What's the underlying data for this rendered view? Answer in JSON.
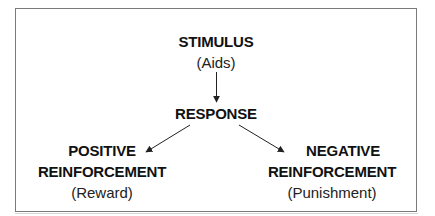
{
  "diagram": {
    "nodes": {
      "stimulus": {
        "title": "STIMULUS",
        "subtitle": "(Aids)"
      },
      "response": {
        "title": "RESPONSE"
      },
      "positive": {
        "title_line1": "POSITIVE",
        "title_line2": "REINFORCEMENT",
        "subtitle": "(Reward)"
      },
      "negative": {
        "title_line1": "NEGATIVE",
        "title_line2": "REINFORCEMENT",
        "subtitle": "(Punishment)"
      }
    },
    "edges": [
      {
        "from": "stimulus",
        "to": "response"
      },
      {
        "from": "response",
        "to": "positive"
      },
      {
        "from": "response",
        "to": "negative"
      }
    ],
    "colors": {
      "line": "#222222",
      "border": "#7a7a7a",
      "background": "#ffffff"
    }
  }
}
